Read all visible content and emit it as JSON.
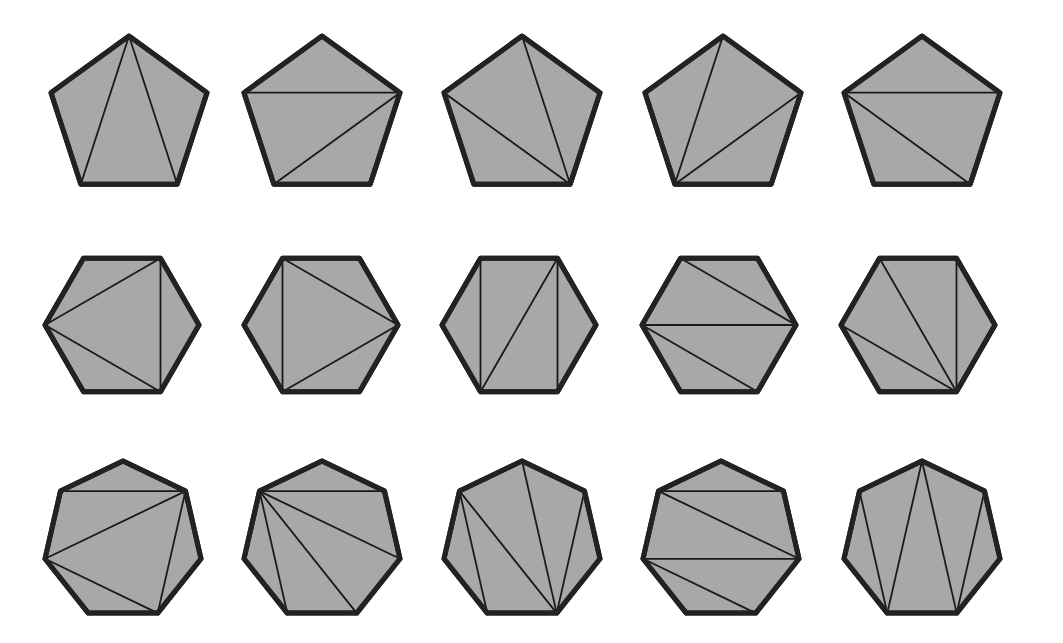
{
  "figure": {
    "colors": {
      "fill": "#a8a8a8",
      "stroke": "#222222",
      "diagonal": "#1a1a1a",
      "background": "#ffffff"
    },
    "rows": [
      {
        "name": "pentagons",
        "sides": 5,
        "vertex_order": [
          "top",
          "upper-left",
          "bottom-left",
          "bottom-right",
          "upper-right"
        ],
        "center_y": 118,
        "radius": 82,
        "centers_x": [
          129,
          322,
          522,
          723,
          922
        ],
        "triangulations": [
          [
            [
              0,
              2
            ],
            [
              0,
              3
            ]
          ],
          [
            [
              1,
              4
            ],
            [
              2,
              4
            ]
          ],
          [
            [
              1,
              3
            ],
            [
              0,
              3
            ]
          ],
          [
            [
              0,
              2
            ],
            [
              2,
              4
            ]
          ],
          [
            [
              1,
              4
            ],
            [
              1,
              3
            ]
          ]
        ]
      },
      {
        "name": "hexagons",
        "sides": 6,
        "vertex_order": [
          "top-left",
          "left",
          "bottom-left",
          "bottom-right",
          "right",
          "top-right"
        ],
        "center_y": 325,
        "radius": 77,
        "centers_x": [
          122,
          321,
          519,
          719,
          918
        ],
        "triangulations": [
          [
            [
              1,
              5
            ],
            [
              1,
              3
            ],
            [
              5,
              3
            ]
          ],
          [
            [
              0,
              2
            ],
            [
              0,
              4
            ],
            [
              2,
              4
            ]
          ],
          [
            [
              0,
              2
            ],
            [
              2,
              5
            ],
            [
              5,
              3
            ]
          ],
          [
            [
              0,
              4
            ],
            [
              1,
              4
            ],
            [
              1,
              3
            ]
          ],
          [
            [
              0,
              3
            ],
            [
              1,
              3
            ],
            [
              5,
              3
            ]
          ]
        ]
      },
      {
        "name": "heptagons",
        "sides": 7,
        "vertex_order": [
          "top",
          "upper-left",
          "left",
          "bottom-left",
          "bottom-right",
          "right",
          "upper-right"
        ],
        "center_y": 541,
        "radius": 80,
        "centers_x": [
          123,
          322,
          522,
          721,
          922
        ],
        "triangulations": [
          [
            [
              1,
              6
            ],
            [
              2,
              6
            ],
            [
              2,
              4
            ],
            [
              4,
              6
            ]
          ],
          [
            [
              1,
              6
            ],
            [
              1,
              5
            ],
            [
              1,
              4
            ],
            [
              1,
              3
            ]
          ],
          [
            [
              1,
              3
            ],
            [
              1,
              4
            ],
            [
              0,
              4
            ],
            [
              4,
              6
            ]
          ],
          [
            [
              1,
              6
            ],
            [
              1,
              5
            ],
            [
              2,
              5
            ],
            [
              2,
              4
            ]
          ],
          [
            [
              1,
              3
            ],
            [
              0,
              3
            ],
            [
              0,
              4
            ],
            [
              4,
              6
            ]
          ]
        ]
      }
    ]
  }
}
